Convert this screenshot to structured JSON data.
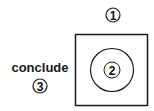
{
  "diagram": {
    "label_text": "conclude",
    "markers": {
      "top": "1",
      "center": "2",
      "left": "3"
    },
    "colors": {
      "stroke": "#1a1a1a",
      "text": "#1a1a1a",
      "background": "#ffffff"
    }
  }
}
